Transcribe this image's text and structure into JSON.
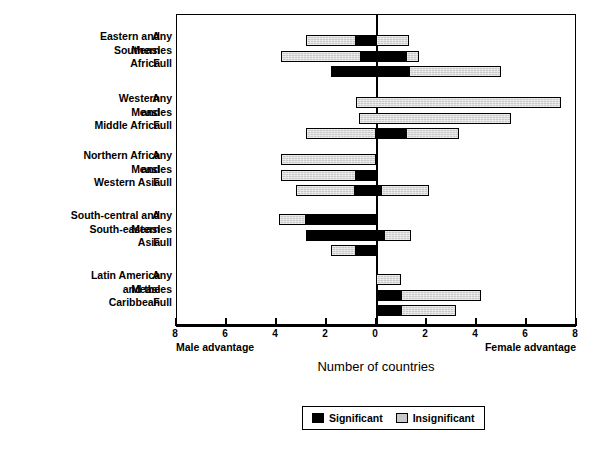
{
  "chart_data": {
    "type": "bar",
    "orientation": "horizontal",
    "title": "",
    "xlabel": "Number of countries",
    "ylabel": "",
    "xlim": [
      -8,
      8
    ],
    "xticks": [
      -8,
      -6,
      -4,
      -2,
      0,
      2,
      4,
      6,
      8
    ],
    "xtick_labels": [
      "8",
      "6",
      "4",
      "2",
      "0",
      "2",
      "4",
      "6",
      "8"
    ],
    "axis_side_labels": {
      "left": "Male advantage",
      "right": "Female advantage"
    },
    "grid": false,
    "legend": {
      "position": "bottom-center",
      "entries": [
        {
          "name": "Significant",
          "color": "#000000"
        },
        {
          "name": "Insignificant",
          "color": "#c9c9c9"
        }
      ]
    },
    "series_names": [
      "Any",
      "Measles",
      "Full"
    ],
    "groups": [
      {
        "label_lines": [
          "Eastern and",
          "Southern",
          "Africa"
        ],
        "rows": [
          {
            "series": "Any",
            "significant": [
              -0.8,
              0.0
            ],
            "insignificant": [
              [
                -2.8,
                -0.8
              ],
              [
                0.0,
                1.3
              ]
            ]
          },
          {
            "series": "Measles",
            "significant": [
              -0.6,
              1.2
            ],
            "insignificant": [
              [
                -3.8,
                -0.6
              ],
              [
                1.2,
                1.7
              ]
            ]
          },
          {
            "series": "Full",
            "significant": [
              -1.8,
              1.3
            ],
            "insignificant": [
              [
                1.3,
                5.0
              ]
            ]
          }
        ]
      },
      {
        "label_lines": [
          "Western",
          "and",
          "Middle Africa"
        ],
        "rows": [
          {
            "series": "Any",
            "significant": null,
            "insignificant": [
              [
                -0.8,
                7.4
              ]
            ]
          },
          {
            "series": "Measles",
            "significant": null,
            "insignificant": [
              [
                -0.7,
                5.4
              ]
            ]
          },
          {
            "series": "Full",
            "significant": [
              0.0,
              1.2
            ],
            "insignificant": [
              [
                -2.8,
                0.0
              ],
              [
                1.2,
                3.3
              ]
            ]
          }
        ]
      },
      {
        "label_lines": [
          "Northern  Africa",
          "and",
          "Western Asia"
        ],
        "rows": [
          {
            "series": "Any",
            "significant": null,
            "insignificant": [
              [
                -3.8,
                0.0
              ]
            ]
          },
          {
            "series": "Measles",
            "significant": [
              -0.8,
              0.0
            ],
            "insignificant": [
              [
                -3.8,
                -0.8
              ]
            ]
          },
          {
            "series": "Full",
            "significant": [
              -0.85,
              0.2
            ],
            "insignificant": [
              [
                -3.2,
                -0.85
              ],
              [
                0.2,
                2.1
              ]
            ]
          }
        ]
      },
      {
        "label_lines": [
          "South-central and",
          "South-eastern",
          "Asia"
        ],
        "rows": [
          {
            "series": "Any",
            "significant": [
              -2.8,
              0.0
            ],
            "insignificant": [
              [
                -3.9,
                -2.8
              ]
            ]
          },
          {
            "series": "Measles",
            "significant": [
              -2.8,
              0.3
            ],
            "insignificant": [
              [
                0.3,
                1.4
              ]
            ]
          },
          {
            "series": "Full",
            "significant": [
              -0.8,
              0.0
            ],
            "insignificant": [
              [
                -1.8,
                -0.8
              ]
            ]
          }
        ]
      },
      {
        "label_lines": [
          "Latin America",
          "and the",
          "Caribbean"
        ],
        "rows": [
          {
            "series": "Any",
            "significant": null,
            "insignificant": [
              [
                0.0,
                1.0
              ]
            ]
          },
          {
            "series": "Measles",
            "significant": [
              0.0,
              1.0
            ],
            "insignificant": [
              [
                1.0,
                4.2
              ]
            ]
          },
          {
            "series": "Full",
            "significant": [
              0.0,
              1.0
            ],
            "insignificant": [
              [
                1.0,
                3.2
              ]
            ]
          }
        ]
      }
    ]
  }
}
